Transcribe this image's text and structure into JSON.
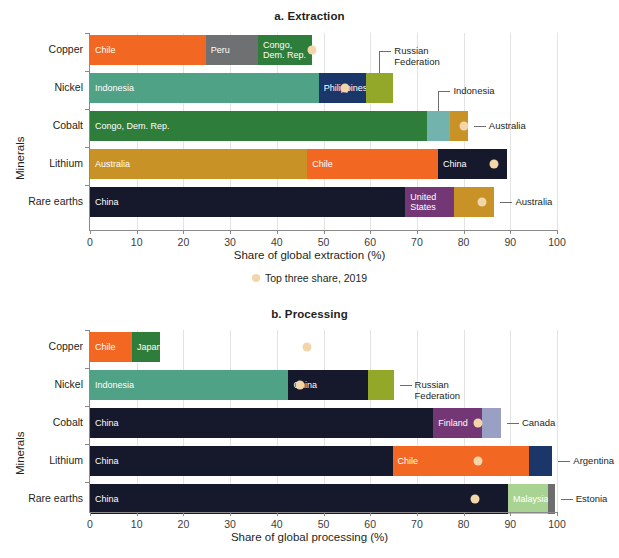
{
  "figure": {
    "legend_label": "Top three share, 2019",
    "legend_marker": "dot-marker"
  },
  "panels": [
    {
      "id": "a",
      "title": "a. Extraction",
      "ylabel": "Minerals",
      "xlabel": "Share of global extraction (%)",
      "ticks": [
        0,
        10,
        20,
        30,
        40,
        50,
        60,
        70,
        80,
        90,
        100
      ],
      "tick_labels": [
        "0",
        "10",
        "20",
        "30",
        "40",
        "50",
        "60",
        "70",
        "80",
        "90",
        "100"
      ]
    },
    {
      "id": "b",
      "title": "b. Processing",
      "ylabel": "Minerals",
      "xlabel": "Share of global processing (%)",
      "ticks": [
        0,
        10,
        20,
        30,
        40,
        50,
        60,
        70,
        80,
        90,
        100
      ],
      "tick_labels": [
        "0",
        "10",
        "20",
        "30",
        "40",
        "50",
        "60",
        "70",
        "80",
        "90",
        "100"
      ]
    }
  ],
  "chart_data": [
    {
      "type": "bar",
      "orientation": "horizontal",
      "stacked": true,
      "title": "a. Extraction",
      "xlabel": "Share of global extraction (%)",
      "ylabel": "Minerals",
      "xlim": [
        0,
        100
      ],
      "grid": true,
      "legend": "Top three share, 2019",
      "categories": [
        "Copper",
        "Nickel",
        "Cobalt",
        "Lithium",
        "Rare earths"
      ],
      "rows": [
        {
          "category": "Copper",
          "marker_value": 47.5,
          "segments": [
            {
              "name": "Chile",
              "value": 24.8,
              "inside_label": "Chile",
              "color": "#f26722"
            },
            {
              "name": "Peru",
              "value": 11.2,
              "inside_label": "Peru",
              "color": "#6f7072"
            },
            {
              "name": "Congo, Dem. Rep.",
              "value": 11.5,
              "inside_label": "Congo,\nDem. Rep.",
              "color": "#2f7d3a"
            }
          ],
          "callouts": []
        },
        {
          "category": "Nickel",
          "marker_value": 54.5,
          "segments": [
            {
              "name": "Indonesia",
              "value": 49.0,
              "inside_label": "Indonesia",
              "color": "#50a287"
            },
            {
              "name": "Philippines",
              "value": 10.1,
              "inside_label": "Philippines",
              "color": "#1b3668"
            },
            {
              "name": "Russian Federation",
              "value": 5.7,
              "inside_label": "",
              "color": "#93a828"
            }
          ],
          "callouts": [
            {
              "name": "Russian Federation",
              "text": "Russian\nFederation"
            }
          ]
        },
        {
          "category": "Cobalt",
          "marker_value": 80.0,
          "segments": [
            {
              "name": "Congo, Dem. Rep.",
              "value": 72.2,
              "inside_label": "Congo, Dem. Rep.",
              "color": "#2f7d3a"
            },
            {
              "name": "Indonesia",
              "value": 4.8,
              "inside_label": "",
              "color": "#72b3ad"
            },
            {
              "name": "Australia",
              "value": 3.9,
              "inside_label": "",
              "color": "#c89226"
            }
          ],
          "callouts": [
            {
              "name": "Indonesia",
              "text": "Indonesia"
            },
            {
              "name": "Australia",
              "text": "Australia"
            }
          ]
        },
        {
          "category": "Lithium",
          "marker_value": 86.5,
          "segments": [
            {
              "name": "Australia",
              "value": 46.5,
              "inside_label": "Australia",
              "color": "#c89226"
            },
            {
              "name": "Chile",
              "value": 28.0,
              "inside_label": "Chile",
              "color": "#f26722"
            },
            {
              "name": "China",
              "value": 14.9,
              "inside_label": "China",
              "color": "#16192c"
            }
          ],
          "callouts": []
        },
        {
          "category": "Rare earths",
          "marker_value": 84.0,
          "segments": [
            {
              "name": "China",
              "value": 67.5,
              "inside_label": "China",
              "color": "#16192c"
            },
            {
              "name": "United States",
              "value": 10.5,
              "inside_label": "United\nStates",
              "color": "#733776"
            },
            {
              "name": "Australia",
              "value": 8.6,
              "inside_label": "",
              "color": "#c89226"
            }
          ],
          "callouts": [
            {
              "name": "Australia",
              "text": "Australia"
            }
          ]
        }
      ]
    },
    {
      "type": "bar",
      "orientation": "horizontal",
      "stacked": true,
      "title": "b. Processing",
      "xlabel": "Share of global processing (%)",
      "ylabel": "Minerals",
      "xlim": [
        0,
        100
      ],
      "grid": true,
      "legend": "Top three share, 2019",
      "categories": [
        "Copper",
        "Nickel",
        "Cobalt",
        "Lithium",
        "Rare earths"
      ],
      "rows": [
        {
          "category": "Copper",
          "marker_value": 46.5,
          "segments": [
            {
              "name": "Chile",
              "value": 9.0,
              "inside_label": "Chile",
              "color": "#f26722"
            },
            {
              "name": "Japan",
              "value": 6.0,
              "inside_label": "Japan",
              "color": "#2f7d3a"
            }
          ],
          "callouts": []
        },
        {
          "category": "Nickel",
          "marker_value": 45.0,
          "segments": [
            {
              "name": "Indonesia",
              "value": 42.5,
              "inside_label": "Indonesia",
              "color": "#50a287"
            },
            {
              "name": "China",
              "value": 17.0,
              "inside_label": "China",
              "color": "#16192c"
            },
            {
              "name": "Russian Federation",
              "value": 5.5,
              "inside_label": "",
              "color": "#93a828"
            }
          ],
          "callouts": [
            {
              "name": "Russian Federation",
              "text": "Russian\nFederation"
            }
          ]
        },
        {
          "category": "Cobalt",
          "marker_value": 83.0,
          "segments": [
            {
              "name": "China",
              "value": 73.5,
              "inside_label": "China",
              "color": "#16192c"
            },
            {
              "name": "Finland",
              "value": 10.5,
              "inside_label": "Finland",
              "color": "#733776"
            },
            {
              "name": "Canada",
              "value": 4.0,
              "inside_label": "",
              "color": "#9aa0c4"
            }
          ],
          "callouts": [
            {
              "name": "Canada",
              "text": "Canada"
            }
          ]
        },
        {
          "category": "Lithium",
          "marker_value": 83.0,
          "segments": [
            {
              "name": "China",
              "value": 64.8,
              "inside_label": "China",
              "color": "#16192c"
            },
            {
              "name": "Chile",
              "value": 29.2,
              "inside_label": "Chile",
              "color": "#f26722"
            },
            {
              "name": "Argentina",
              "value": 5.0,
              "inside_label": "",
              "color": "#1b3668"
            }
          ],
          "callouts": [
            {
              "name": "Argentina",
              "text": "Argentina"
            }
          ]
        },
        {
          "category": "Rare earths",
          "marker_value": 82.5,
          "segments": [
            {
              "name": "China",
              "value": 89.5,
              "inside_label": "China",
              "color": "#16192c"
            },
            {
              "name": "Malaysia",
              "value": 8.5,
              "inside_label": "Malaysia",
              "color": "#a9d393"
            },
            {
              "name": "Estonia",
              "value": 1.5,
              "inside_label": "",
              "color": "#6d6d6d"
            }
          ],
          "callouts": [
            {
              "name": "Estonia",
              "text": "Estonia"
            }
          ]
        }
      ]
    }
  ]
}
